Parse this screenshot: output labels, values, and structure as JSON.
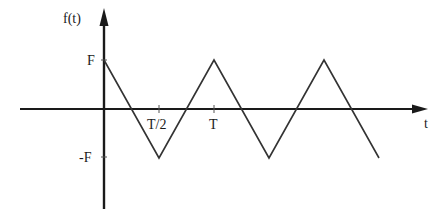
{
  "chart_data": {
    "type": "line",
    "title": "",
    "xlabel": "t",
    "ylabel": "f(t)",
    "x_tick_labels": [
      "T/2",
      "T"
    ],
    "y_tick_labels": [
      "F",
      "-F"
    ],
    "series": [
      {
        "name": "f(t)",
        "x": [
          0,
          0.5,
          1.0,
          1.5,
          2.0,
          2.5
        ],
        "x_units": "T",
        "values": [
          1,
          -1,
          1,
          -1,
          1,
          -1
        ],
        "y_units": "F"
      }
    ],
    "xlim": [
      -0.76,
      2.95
    ],
    "ylim": [
      -2.05,
      2.06
    ],
    "grid": false,
    "legend": null
  },
  "labels": {
    "y_axis": "f(t)",
    "x_axis": "t",
    "y_pos": "F",
    "y_neg": "-F",
    "x_half": "T/2",
    "x_full": "T"
  },
  "colors": {
    "axis": "#1a1a1a",
    "wave": "#333333",
    "background": "#ffffff"
  }
}
